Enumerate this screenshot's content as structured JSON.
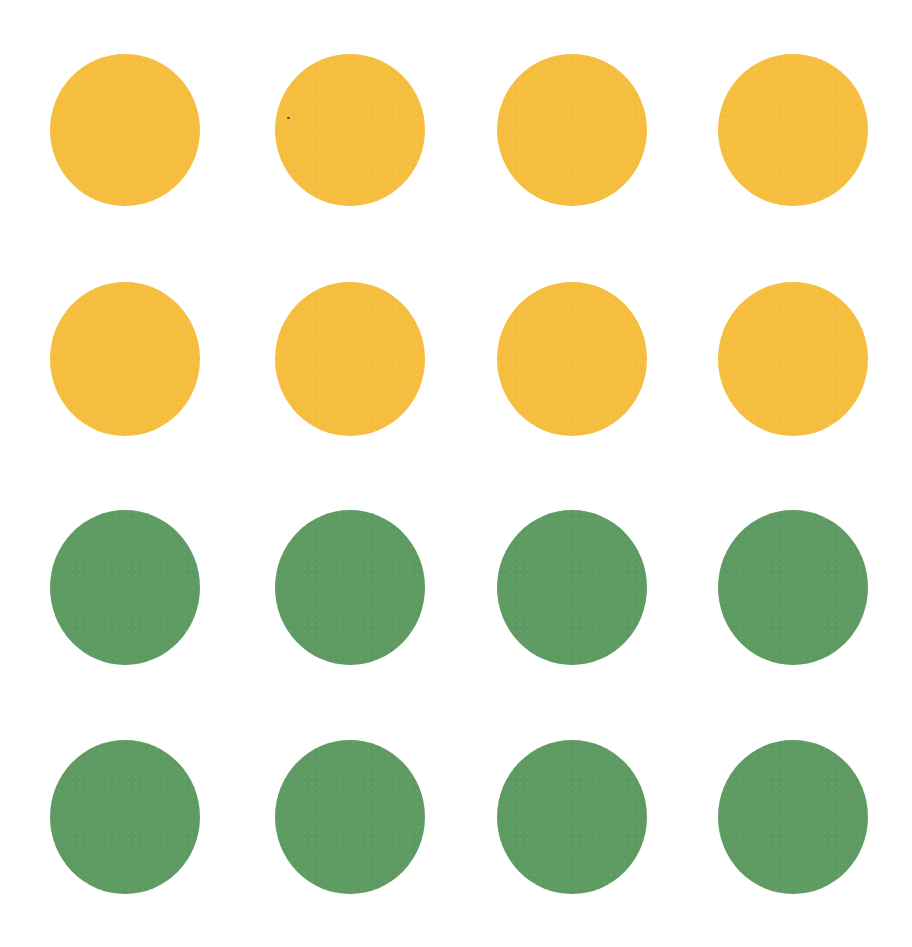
{
  "canvas": {
    "width": 912,
    "height": 947,
    "background_color": "#ffffff",
    "description": "Four-by-four grid of solid filled circles, top two rows amber-yellow, bottom two rows green"
  },
  "palette": {
    "yellow": "#F6BE3E",
    "green": "#5E9B62",
    "background": "#ffffff",
    "speck": "#4a4030"
  },
  "grid": {
    "rows": 4,
    "columns": 4,
    "total_dots": 16,
    "column_left_edges": [
      50,
      275,
      497,
      718
    ],
    "row_top_edges": [
      54,
      282,
      510,
      740
    ],
    "dot_width": 150,
    "dot_height": 152,
    "row_gap": 76,
    "column_gap": 74
  },
  "rows": [
    {
      "index": 0,
      "color_name": "yellow",
      "color": "#F6BE3E",
      "top": 54,
      "dots": [
        {
          "name": "dot-r1c1",
          "left": 50,
          "top": 54,
          "w": 150,
          "h": 152,
          "color": "#F6BE3E"
        },
        {
          "name": "dot-r1c2",
          "left": 275,
          "top": 54,
          "w": 150,
          "h": 152,
          "color": "#F6BE3E"
        },
        {
          "name": "dot-r1c3",
          "left": 497,
          "top": 54,
          "w": 150,
          "h": 152,
          "color": "#F6BE3E"
        },
        {
          "name": "dot-r1c4",
          "left": 718,
          "top": 54,
          "w": 150,
          "h": 152,
          "color": "#F6BE3E"
        }
      ]
    },
    {
      "index": 1,
      "color_name": "yellow",
      "color": "#F6BE3E",
      "top": 282,
      "dots": [
        {
          "name": "dot-r2c1",
          "left": 50,
          "top": 282,
          "w": 150,
          "h": 154,
          "color": "#F6BE3E"
        },
        {
          "name": "dot-r2c2",
          "left": 275,
          "top": 282,
          "w": 150,
          "h": 154,
          "color": "#F6BE3E"
        },
        {
          "name": "dot-r2c3",
          "left": 497,
          "top": 282,
          "w": 150,
          "h": 154,
          "color": "#F6BE3E"
        },
        {
          "name": "dot-r2c4",
          "left": 718,
          "top": 282,
          "w": 150,
          "h": 154,
          "color": "#F6BE3E"
        }
      ]
    },
    {
      "index": 2,
      "color_name": "green",
      "color": "#5E9B62",
      "top": 510,
      "dots": [
        {
          "name": "dot-r3c1",
          "left": 50,
          "top": 510,
          "w": 150,
          "h": 155,
          "color": "#5E9B62"
        },
        {
          "name": "dot-r3c2",
          "left": 275,
          "top": 510,
          "w": 150,
          "h": 155,
          "color": "#5E9B62"
        },
        {
          "name": "dot-r3c3",
          "left": 497,
          "top": 510,
          "w": 150,
          "h": 155,
          "color": "#5E9B62"
        },
        {
          "name": "dot-r3c4",
          "left": 718,
          "top": 510,
          "w": 150,
          "h": 155,
          "color": "#5E9B62"
        }
      ]
    },
    {
      "index": 3,
      "color_name": "green",
      "color": "#5E9B62",
      "top": 740,
      "dots": [
        {
          "name": "dot-r4c1",
          "left": 50,
          "top": 740,
          "w": 150,
          "h": 154,
          "color": "#5E9B62"
        },
        {
          "name": "dot-r4c2",
          "left": 275,
          "top": 740,
          "w": 150,
          "h": 154,
          "color": "#5E9B62"
        },
        {
          "name": "dot-r4c3",
          "left": 497,
          "top": 740,
          "w": 150,
          "h": 154,
          "color": "#5E9B62"
        },
        {
          "name": "dot-r4c4",
          "left": 718,
          "top": 740,
          "w": 150,
          "h": 154,
          "color": "#5E9B62"
        }
      ]
    }
  ],
  "artifacts": [
    {
      "name": "speck-mark",
      "left": 287,
      "top": 117,
      "color": "#4a4030",
      "note": "tiny dark speck on the second dot of the first row"
    }
  ]
}
